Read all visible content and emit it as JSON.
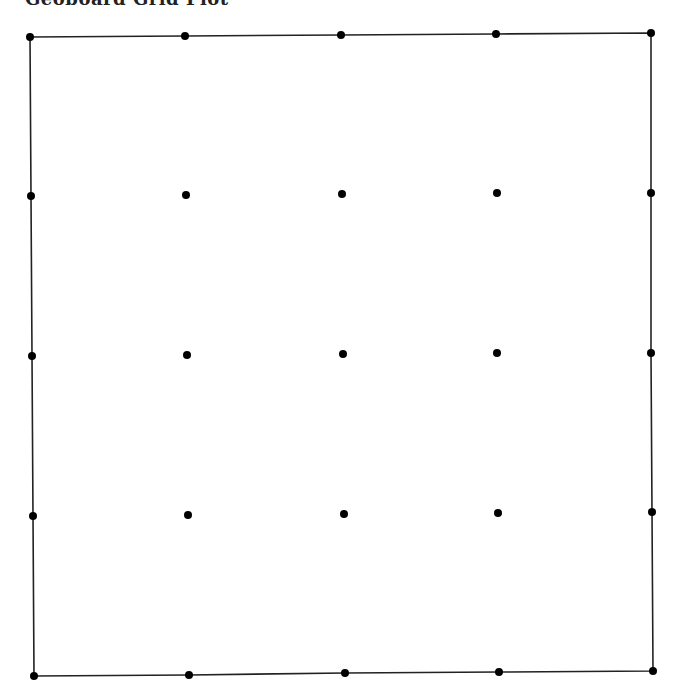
{
  "title": "Geoboard Grid Plot",
  "grid": {
    "rows": 5,
    "cols": 5,
    "line_color": "#222222",
    "dot_color": "#000000",
    "points": [
      [
        [
          30,
          37
        ],
        [
          185,
          36
        ],
        [
          341,
          35
        ],
        [
          496,
          34
        ],
        [
          651,
          33
        ]
      ],
      [
        [
          31,
          196
        ],
        [
          186,
          195
        ],
        [
          342,
          194
        ],
        [
          497,
          193
        ],
        [
          651,
          193
        ]
      ],
      [
        [
          32,
          356
        ],
        [
          187,
          355
        ],
        [
          343,
          354
        ],
        [
          497,
          353
        ],
        [
          651,
          353
        ]
      ],
      [
        [
          33,
          516
        ],
        [
          188,
          515
        ],
        [
          344,
          514
        ],
        [
          498,
          513
        ],
        [
          652,
          512
        ]
      ],
      [
        [
          34,
          676
        ],
        [
          189,
          675
        ],
        [
          345,
          673
        ],
        [
          499,
          672
        ],
        [
          653,
          671
        ]
      ]
    ]
  }
}
